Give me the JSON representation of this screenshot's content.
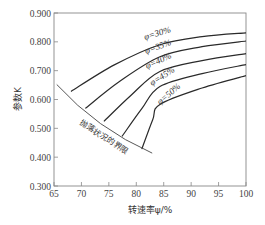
{
  "chart_data": {
    "type": "line",
    "title": "",
    "xlabel": "转速率ψ/%",
    "ylabel": "参数K",
    "xlim": [
      65,
      100
    ],
    "ylim": [
      0.3,
      0.9
    ],
    "x_ticks": [
      65,
      70,
      75,
      80,
      85,
      90,
      95,
      100
    ],
    "x_tick_labels": [
      "65",
      "70",
      "75",
      "80",
      "85",
      "90",
      "95",
      "100"
    ],
    "y_ticks": [
      0.3,
      0.4,
      0.5,
      0.6,
      0.7,
      0.8,
      0.9
    ],
    "y_tick_labels": [
      "0.300",
      "0.400",
      "0.500",
      "0.600",
      "0.700",
      "0.800",
      "0.900"
    ],
    "grid": false,
    "legend": "inline labels on curves",
    "series": [
      {
        "name": "φ=30%",
        "label": "φ=30%",
        "x": [
          68.1,
          76,
          84.3,
          92,
          100
        ],
        "values": [
          0.628,
          0.72,
          0.79,
          0.818,
          0.831
        ]
      },
      {
        "name": "φ=35%",
        "label": "φ=35%",
        "x": [
          70.7,
          77,
          84.3,
          92,
          100
        ],
        "values": [
          0.569,
          0.663,
          0.748,
          0.783,
          0.803
        ]
      },
      {
        "name": "φ=40%",
        "label": "φ=40%",
        "x": [
          74.1,
          79,
          84.3,
          92,
          100
        ],
        "values": [
          0.524,
          0.614,
          0.697,
          0.735,
          0.759
        ]
      },
      {
        "name": "φ=45%",
        "label": "φ=45%",
        "x": [
          77.4,
          81,
          84.3,
          92,
          100
        ],
        "values": [
          0.472,
          0.568,
          0.645,
          0.69,
          0.721
        ]
      },
      {
        "name": "φ=50%",
        "label": "φ=50%",
        "x": [
          81.0,
          83,
          84.3,
          92,
          100
        ],
        "values": [
          0.428,
          0.53,
          0.583,
          0.64,
          0.683
        ]
      }
    ],
    "boundary": {
      "label": "抛落状况的界限",
      "x": [
        65.5,
        82.9
      ],
      "values": [
        0.652,
        0.414
      ]
    }
  }
}
